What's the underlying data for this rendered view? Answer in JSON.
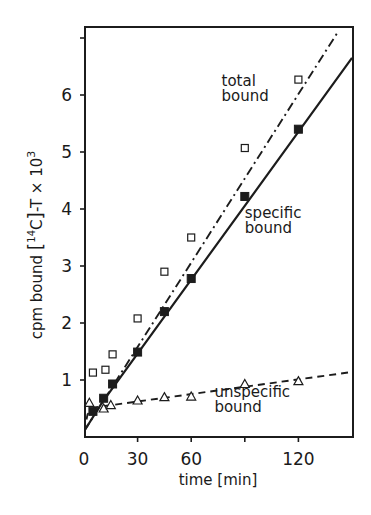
{
  "chart_data": {
    "type": "line",
    "title": "",
    "xlabel": "time [min]",
    "ylabel": "cpm bound [14C]-T × 10³",
    "ylabel_parts": {
      "prefix": "cpm  bound  ",
      "bracket_open": "[",
      "superscript_mass": "14",
      "element": "C",
      "bracket_close": "]",
      "suffix": "-T × 10",
      "exponent": "3"
    },
    "xlim": [
      0,
      150
    ],
    "ylim": [
      0,
      7.1
    ],
    "xticks": [
      0,
      30,
      60,
      90,
      120
    ],
    "xtick_labels": [
      "0",
      "30",
      "60",
      "",
      "120"
    ],
    "yticks": [
      1,
      2,
      3,
      4,
      5,
      6,
      7
    ],
    "ytick_labels": [
      "1",
      "2",
      "3",
      "4",
      "5",
      "6",
      ""
    ],
    "grid": false,
    "legend": "none (inline annotations)",
    "series": [
      {
        "name": "total bound",
        "marker": "open-square",
        "line_style": "dash-dot",
        "x": [
          5,
          12,
          16,
          30,
          45,
          60,
          90,
          120
        ],
        "y": [
          1.13,
          1.18,
          1.45,
          2.08,
          2.9,
          3.5,
          5.07,
          6.27
        ],
        "fit_line": [
          [
            0,
            0.1
          ],
          [
            142,
            7.1
          ]
        ]
      },
      {
        "name": "specific bound",
        "marker": "filled-square",
        "line_style": "solid",
        "x": [
          5,
          11,
          16,
          30,
          45,
          60,
          90,
          120
        ],
        "y": [
          0.45,
          0.68,
          0.93,
          1.49,
          2.2,
          2.78,
          4.22,
          5.4
        ],
        "fit_line": [
          [
            0,
            0.1
          ],
          [
            10,
            0.6
          ],
          [
            150,
            6.65
          ]
        ]
      },
      {
        "name": "unspecific bound",
        "marker": "open-triangle",
        "line_style": "dashed",
        "x": [
          3,
          11,
          15,
          30,
          45,
          60,
          90,
          120
        ],
        "y": [
          0.6,
          0.5,
          0.56,
          0.64,
          0.7,
          0.71,
          0.93,
          0.98
        ],
        "fit_line": [
          [
            0,
            0.1
          ],
          [
            2,
            0.4
          ],
          [
            6,
            0.52
          ],
          [
            150,
            1.14
          ]
        ]
      }
    ],
    "annotations": [
      {
        "text_lines": [
          "total",
          "bound"
        ],
        "x": 77,
        "y": 6.15
      },
      {
        "text_lines": [
          "specific",
          "bound"
        ],
        "x": 90,
        "y": 3.85
      },
      {
        "text_lines": [
          "unspecific",
          "bound"
        ],
        "x": 73,
        "y": 0.7
      }
    ]
  }
}
